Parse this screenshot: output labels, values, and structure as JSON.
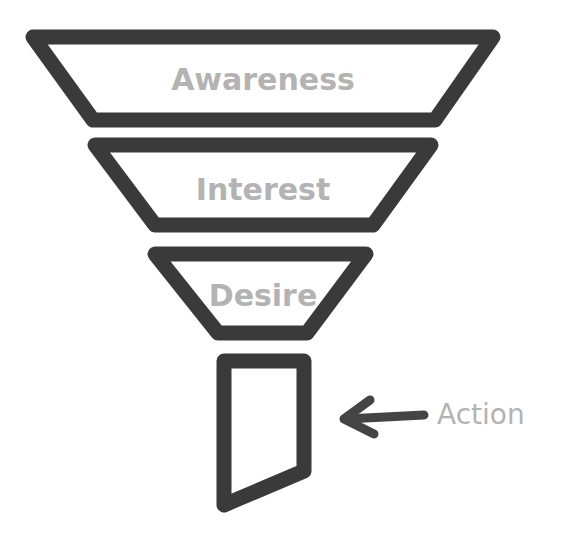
{
  "diagram": {
    "type": "AIDA marketing funnel",
    "colors": {
      "outline": "#3a3a3a",
      "label": "#b3b3b3",
      "background": "#ffffff"
    },
    "stages": [
      {
        "label": "Awareness"
      },
      {
        "label": "Interest"
      },
      {
        "label": "Desire"
      },
      {
        "label": "Action"
      }
    ],
    "action_pointer": {
      "icon": "arrow-left-icon",
      "label": "Action"
    }
  }
}
